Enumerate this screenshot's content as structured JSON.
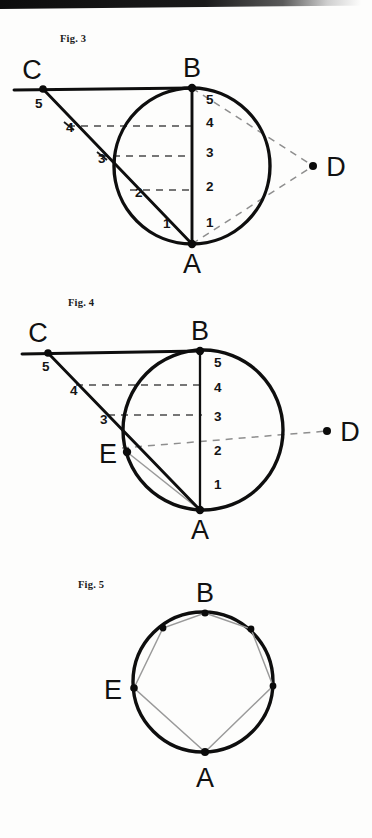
{
  "page": {
    "width": 372,
    "height": 838,
    "background_color": "#fdfdfc",
    "ink_color": "#0e0e0e",
    "dashed_color": "#8e8e8e",
    "gray_chord_color": "#9a9a9a"
  },
  "figures": [
    {
      "id": "fig3",
      "caption": "Fig. 3",
      "caption_pos": {
        "x": 60,
        "y": 42
      },
      "circle": {
        "cx": 192,
        "cy": 166,
        "r": 78
      },
      "points": [
        {
          "name": "A",
          "label": "A",
          "x": 192,
          "y": 244,
          "label_x": 192,
          "label_y": 273,
          "has_dot": true
        },
        {
          "name": "B",
          "label": "B",
          "x": 192,
          "y": 88,
          "label_x": 192,
          "label_y": 77,
          "has_dot": true
        },
        {
          "name": "C",
          "label": "C",
          "x": 43,
          "y": 89,
          "label_x": 32,
          "label_y": 79,
          "has_dot": true
        },
        {
          "name": "D",
          "label": "D",
          "x": 313,
          "y": 166,
          "label_x": 336,
          "label_y": 176,
          "has_dot": true
        }
      ],
      "diameter_numbers": [
        "5",
        "4",
        "3",
        "2",
        "1"
      ],
      "diameter_number_x": 206,
      "diameter_number_ys": [
        104,
        127,
        157,
        191,
        227
      ],
      "ca_numbers": [
        "5",
        "4",
        "3",
        "2",
        "1"
      ],
      "ca_number_positions": [
        {
          "t": "5",
          "x": 35,
          "y": 108
        },
        {
          "t": "4",
          "x": 66,
          "y": 132
        },
        {
          "t": "3",
          "x": 98,
          "y": 163
        },
        {
          "t": "2",
          "x": 135,
          "y": 197
        },
        {
          "t": "1",
          "x": 163,
          "y": 228
        }
      ],
      "dashed_rows": [
        {
          "x1": 68,
          "x2": 193,
          "y": 126
        },
        {
          "x1": 100,
          "x2": 193,
          "y": 156
        },
        {
          "x1": 130,
          "x2": 193,
          "y": 190
        }
      ],
      "solid_segments": [
        {
          "name": "tangent-line-through-C-to-B",
          "x1": 14,
          "y1": 90,
          "x2": 192,
          "y2": 88
        },
        {
          "name": "line-C-to-A",
          "x1": 43,
          "y1": 89,
          "x2": 192,
          "y2": 244
        },
        {
          "name": "diameter-B-to-A",
          "x1": 192,
          "y1": 88,
          "x2": 192,
          "y2": 244
        }
      ],
      "dashed_segments": [
        {
          "name": "line-B-to-D",
          "x1": 192,
          "y1": 88,
          "x2": 313,
          "y2": 166
        },
        {
          "name": "line-A-to-D",
          "x1": 192,
          "y1": 244,
          "x2": 313,
          "y2": 166
        }
      ]
    },
    {
      "id": "fig4",
      "caption": "Fig. 4",
      "caption_pos": {
        "x": 68,
        "y": 306
      },
      "circle": {
        "cx": 203,
        "cy": 430,
        "r": 80
      },
      "points": [
        {
          "name": "A",
          "label": "A",
          "x": 200,
          "y": 510,
          "label_x": 200,
          "label_y": 539,
          "has_dot": true
        },
        {
          "name": "B",
          "label": "B",
          "x": 200,
          "y": 351,
          "label_x": 200,
          "label_y": 340,
          "has_dot": true
        },
        {
          "name": "C",
          "label": "C",
          "x": 48,
          "y": 353,
          "label_x": 38,
          "label_y": 342,
          "has_dot": true
        },
        {
          "name": "D",
          "label": "D",
          "x": 327,
          "y": 431,
          "label_x": 348,
          "label_y": 441,
          "has_dot": true
        },
        {
          "name": "E",
          "label": "E",
          "x": 127,
          "y": 452,
          "label_x": 110,
          "label_y": 463,
          "has_dot": true
        }
      ],
      "diameter_numbers": [
        "5",
        "4",
        "3",
        "2",
        "1"
      ],
      "diameter_number_x": 214,
      "diameter_number_ys": [
        367,
        392,
        421,
        455,
        489
      ],
      "ca_number_positions": [
        {
          "t": "5",
          "x": 42,
          "y": 371
        },
        {
          "t": "4",
          "x": 70,
          "y": 395
        },
        {
          "t": "3",
          "x": 100,
          "y": 424
        }
      ],
      "dashed_rows": [
        {
          "x1": 76,
          "x2": 202,
          "y": 385
        },
        {
          "x1": 108,
          "x2": 202,
          "y": 415
        }
      ],
      "solid_segments": [
        {
          "name": "tangent-line-through-C-to-B",
          "x1": 22,
          "y1": 354,
          "x2": 200,
          "y2": 351
        },
        {
          "name": "line-C-to-A",
          "x1": 48,
          "y1": 353,
          "x2": 200,
          "y2": 510
        },
        {
          "name": "diameter-B-to-A",
          "x1": 200,
          "y1": 351,
          "x2": 200,
          "y2": 510
        }
      ],
      "dashed_segments": [
        {
          "name": "line-E-to-D",
          "x1": 122,
          "y1": 448,
          "x2": 327,
          "y2": 431
        }
      ],
      "gray_segments": [
        {
          "name": "chord-E-to-A",
          "x1": 127,
          "y1": 452,
          "x2": 200,
          "y2": 510
        }
      ]
    },
    {
      "id": "fig5",
      "caption": "Fig. 5",
      "caption_pos": {
        "x": 78,
        "y": 578
      },
      "circle": {
        "cx": 203,
        "cy": 682,
        "r": 70
      },
      "points": [
        {
          "name": "A",
          "label": "A",
          "x": 205,
          "y": 752,
          "label_x": 205,
          "label_y": 787,
          "has_dot": true
        },
        {
          "name": "B",
          "label": "B",
          "x": 205,
          "y": 613,
          "label_x": 205,
          "label_y": 602,
          "has_dot": true
        },
        {
          "name": "E",
          "label": "E",
          "x": 134,
          "y": 688,
          "label_x": 113,
          "label_y": 699,
          "has_dot": true
        },
        {
          "name": "v2",
          "label": "",
          "x": 163,
          "y": 628,
          "has_dot": true
        },
        {
          "name": "v3",
          "label": "",
          "x": 251,
          "y": 629,
          "has_dot": true
        },
        {
          "name": "v4",
          "label": "",
          "x": 273,
          "y": 686,
          "has_dot": true
        }
      ],
      "polygon_name": "inscribed-hexagon",
      "polygon_vertices": [
        {
          "x": 205,
          "y": 613
        },
        {
          "x": 251,
          "y": 629
        },
        {
          "x": 273,
          "y": 686
        },
        {
          "x": 205,
          "y": 752
        },
        {
          "x": 134,
          "y": 688
        },
        {
          "x": 163,
          "y": 628
        }
      ]
    }
  ]
}
